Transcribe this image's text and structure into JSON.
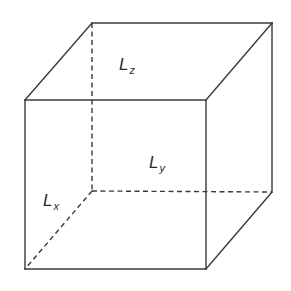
{
  "diagram": {
    "type": "3d-box-wireframe",
    "stroke_color": "#3a3a3a",
    "vertices": {
      "front_top_left": [
        25,
        100
      ],
      "front_top_right": [
        206,
        100
      ],
      "front_bottom_left": [
        25,
        269
      ],
      "front_bottom_right": [
        206,
        269
      ],
      "back_top_left": [
        92,
        23
      ],
      "back_top_right": [
        272,
        23
      ],
      "back_bottom_left": [
        92,
        191
      ],
      "back_bottom_right": [
        272,
        192
      ]
    },
    "labels": {
      "lz": {
        "main": "L",
        "sub": "z"
      },
      "ly": {
        "main": "L",
        "sub": "y"
      },
      "lx": {
        "main": "L",
        "sub": "x"
      }
    }
  }
}
